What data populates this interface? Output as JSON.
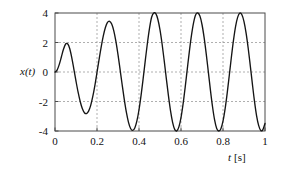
{
  "chart_data": {
    "type": "line",
    "title": "",
    "subtitle": "",
    "xlabel": "t [s]",
    "ylabel": "x(t)",
    "xlabel_symbol": "t",
    "xlabel_unit": "[s]",
    "ylabel_symbol": "x(t)",
    "xlim": [
      0,
      1
    ],
    "ylim": [
      -4,
      4
    ],
    "xticks": [
      0,
      0.2,
      0.4,
      0.6,
      0.8,
      1
    ],
    "xtick_labels": [
      "0",
      "0.2",
      "0.4",
      "0.6",
      "0.8",
      "1"
    ],
    "yticks": [
      -4,
      -2,
      0,
      2,
      4
    ],
    "ytick_labels": [
      "-4",
      "-2",
      "0",
      "2",
      "4"
    ],
    "grid": true,
    "grid_style": "dotted",
    "grid_color": "#8c8c8c",
    "legend": null,
    "series": [
      {
        "name": "x(t)",
        "color": "#151515",
        "description": "Damped-rise sinusoid: amplitude grows from 0 toward 4, frequency 5 Hz",
        "amplitude_final": 4,
        "frequency_hz": 5,
        "period_s": 0.2,
        "envelope": "4*(1-exp(-t/0.09))",
        "peaks": [
          {
            "t": 0.05,
            "x": 1.9
          },
          {
            "t": 0.25,
            "x": 3.6
          },
          {
            "t": 0.45,
            "x": 3.95
          },
          {
            "t": 0.65,
            "x": 4.0
          },
          {
            "t": 0.85,
            "x": 4.0
          }
        ],
        "troughs": [
          {
            "t": 0.15,
            "x": -2.85
          },
          {
            "t": 0.35,
            "x": -3.9
          },
          {
            "t": 0.55,
            "x": -4.0
          },
          {
            "t": 0.75,
            "x": -4.0
          },
          {
            "t": 0.95,
            "x": -4.0
          }
        ],
        "zero_crossings": [
          0,
          0.1,
          0.2,
          0.3,
          0.4,
          0.5,
          0.6,
          0.7,
          0.8,
          0.9,
          1.0
        ],
        "x": [
          0,
          0.01,
          0.02,
          0.03,
          0.04,
          0.05,
          0.06,
          0.07,
          0.08,
          0.09,
          0.1,
          0.11,
          0.12,
          0.13,
          0.14,
          0.15,
          0.16,
          0.17,
          0.18,
          0.19,
          0.2,
          0.21,
          0.22,
          0.23,
          0.24,
          0.25,
          0.26,
          0.27,
          0.28,
          0.29,
          0.3,
          0.31,
          0.32,
          0.33,
          0.34,
          0.35,
          0.36,
          0.37,
          0.38,
          0.39,
          0.4,
          0.41,
          0.42,
          0.43,
          0.44,
          0.45,
          0.46,
          0.47,
          0.48,
          0.49,
          0.5,
          0.51,
          0.52,
          0.53,
          0.54,
          0.55,
          0.56,
          0.57,
          0.58,
          0.59,
          0.6,
          0.61,
          0.62,
          0.63,
          0.64,
          0.65,
          0.66,
          0.67,
          0.68,
          0.69,
          0.7,
          0.71,
          0.72,
          0.73,
          0.74,
          0.75,
          0.76,
          0.77,
          0.78,
          0.79,
          0.8,
          0.81,
          0.82,
          0.83,
          0.84,
          0.85,
          0.86,
          0.87,
          0.88,
          0.89,
          0.9,
          0.91,
          0.92,
          0.93,
          0.94,
          0.95,
          0.96,
          0.97,
          0.98,
          0.99,
          1.0
        ],
        "y": [
          0.0,
          0.13,
          0.5,
          1.0,
          1.53,
          1.88,
          1.91,
          1.59,
          0.96,
          0.18,
          -0.62,
          -1.37,
          -2.0,
          -2.48,
          -2.76,
          -2.82,
          -2.65,
          -2.26,
          -1.66,
          -0.9,
          -0.03,
          0.86,
          1.71,
          2.45,
          3.02,
          3.36,
          3.44,
          3.25,
          2.79,
          2.08,
          1.18,
          0.16,
          -0.88,
          -1.87,
          -2.74,
          -3.41,
          -3.83,
          -3.96,
          -3.79,
          -3.32,
          -2.56,
          -1.57,
          -0.42,
          0.79,
          1.95,
          2.96,
          3.71,
          4.0,
          3.95,
          3.56,
          2.86,
          1.9,
          0.77,
          -0.43,
          -1.59,
          -2.62,
          -3.41,
          -3.89,
          -3.99,
          -3.72,
          -3.09,
          -2.16,
          -1.02,
          0.21,
          1.42,
          2.5,
          3.35,
          3.88,
          4.0,
          3.79,
          3.22,
          2.35,
          1.25,
          0.03,
          -1.21,
          -2.34,
          -3.25,
          -3.83,
          -4.0,
          -3.84,
          -3.33,
          -2.5,
          -1.43,
          -0.22,
          1.02,
          2.16,
          3.1,
          3.72,
          3.99,
          3.88,
          3.42,
          2.64,
          1.61,
          0.42,
          -0.82,
          -1.99,
          -2.97,
          -3.64,
          -3.97,
          -3.91,
          -3.49
        ]
      }
    ]
  }
}
